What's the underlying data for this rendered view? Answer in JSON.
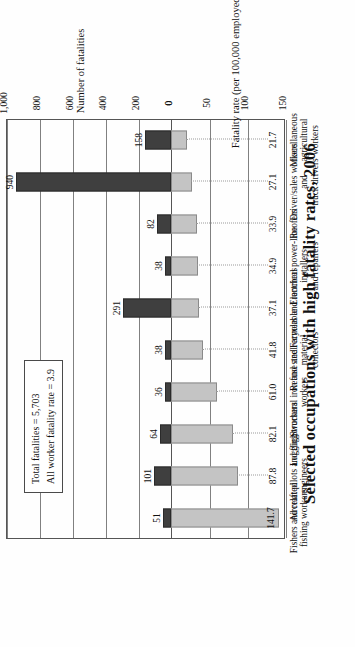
{
  "chart_data": {
    "type": "bar",
    "title": "Selected occupations with high fatality rates, 2006",
    "categories": [
      "Fishers and related\nfishing workers",
      "Aircraft pilots and flight\nengineers",
      "Logging workers",
      "Structural iron and steel\nworkers",
      "Refuse and recyclable material\ncollectors",
      "Farmers and ranchers",
      "Electrical power-line installers\nand repairers",
      "Roofers",
      "Driver/sales workers and\ntruck drivers",
      "Miscellaneous agricultural\nworkers"
    ],
    "series": [
      {
        "name": "Number of fatalities",
        "axis": "top",
        "values": [
          51,
          101,
          64,
          36,
          38,
          291,
          38,
          82,
          940,
          158
        ]
      },
      {
        "name": "Fatality rate (per 100,000 employed)",
        "axis": "bottom",
        "values": [
          141.7,
          87.8,
          82.1,
          61.0,
          41.8,
          37.1,
          34.9,
          33.9,
          27.1,
          21.7
        ]
      }
    ],
    "axis_top": {
      "label": "Number of fatalities",
      "ticks": [
        "0",
        "200",
        "400",
        "600",
        "800",
        "1,000"
      ],
      "tick_values": [
        0,
        200,
        400,
        600,
        800,
        1000
      ],
      "range": [
        0,
        1000
      ]
    },
    "axis_bottom": {
      "label": "Fatality rate (per 100,000 employed)",
      "ticks": [
        "0",
        "50",
        "100",
        "150"
      ],
      "tick_values": [
        0,
        50,
        100,
        150
      ],
      "range": [
        0,
        150
      ]
    },
    "grid": true,
    "legend": "none",
    "colors": {
      "fatality_count_bar": "#3f3f3f",
      "fatality_rate_bar": "#c4c4c4",
      "axis": "#555555",
      "grid": "#808080"
    }
  },
  "annotation": {
    "line1": "Total fatalities = 5,703",
    "line2": "All worker fatality rate = 3.9"
  },
  "value_labels": {
    "counts": [
      "51",
      "101",
      "64",
      "36",
      "38",
      "291",
      "38",
      "82",
      "940",
      "158"
    ],
    "rates": [
      "141.7",
      "87.8",
      "82.1",
      "61.0",
      "41.8",
      "37.1",
      "34.9",
      "33.9",
      "27.1",
      "21.7"
    ]
  }
}
